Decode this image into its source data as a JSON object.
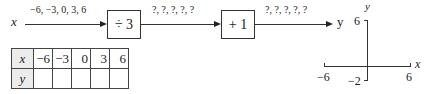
{
  "flow": {
    "input_var": "x",
    "input_values": "−6, −3, 0, 3, 6",
    "step1": {
      "label": "÷ 3"
    },
    "mid_values": "?, ?, ?, ?, ?",
    "step2": {
      "label": "+ 1"
    },
    "output_values": "?, ?, ?, ?, ?",
    "output_var": "y"
  },
  "table": {
    "row_x": {
      "header": "x",
      "cells": [
        "−6",
        "−3",
        "0",
        "3",
        "6"
      ]
    },
    "row_y": {
      "header": "y",
      "cells": [
        "",
        "",
        "",
        "",
        ""
      ]
    }
  },
  "axes": {
    "x_label": "x",
    "y_label": "y",
    "x_min": "−6",
    "x_max": "6",
    "y_min": "−2",
    "y_max": "6"
  }
}
